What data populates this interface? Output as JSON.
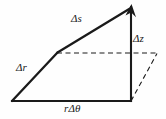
{
  "figure": {
    "background_color": "#fefefe",
    "stroke_color": "#1a1a1a",
    "labels": {
      "delta_s": "Δs",
      "delta_z": "Δz",
      "delta_r": "Δr",
      "r_delta_theta": "rΔθ"
    },
    "geometry": {
      "origin": [
        12,
        101
      ],
      "bend": [
        57,
        53
      ],
      "apex": [
        131,
        6
      ],
      "base_right": [
        131,
        101
      ],
      "far_right": [
        157,
        53
      ],
      "solid_edges": [
        {
          "name": "delta-r-segment",
          "from": [
            12,
            101
          ],
          "to": [
            57,
            53
          ]
        },
        {
          "name": "delta-s-segment",
          "from": [
            57,
            53
          ],
          "to": [
            131,
            6
          ]
        },
        {
          "name": "vertical-delta-z-edge",
          "from": [
            131,
            6
          ],
          "to": [
            131,
            101
          ]
        },
        {
          "name": "base-r-delta-theta-edge",
          "from": [
            12,
            101
          ],
          "to": [
            131,
            101
          ]
        }
      ],
      "dashed_edges": [
        {
          "name": "horizontal-projection-line",
          "from": [
            57,
            53
          ],
          "to": [
            157,
            53
          ]
        },
        {
          "name": "diagonal-projection-line",
          "from": [
            131,
            101
          ],
          "to": [
            157,
            53
          ]
        }
      ],
      "arrowhead_at": [
        131,
        6
      ]
    }
  }
}
